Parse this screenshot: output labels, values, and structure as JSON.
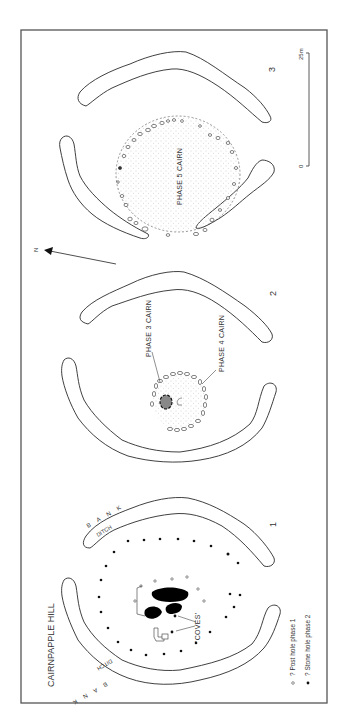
{
  "title": "CAIRNPAPPLE HILL",
  "phases": [
    {
      "number": "1",
      "labels": {
        "bank_top": "B A N K",
        "ditch_top": "DITCH",
        "bank_bottom": "B A N K",
        "ditch_bottom": "DITCH",
        "coves": "'COVES'"
      }
    },
    {
      "number": "2",
      "labels": {
        "phase3": "PHASE 3 CAIRN",
        "phase4": "PHASE 4 CAIRN"
      }
    },
    {
      "number": "3",
      "labels": {
        "phase5": "PHASE 5 CAIRN"
      }
    }
  ],
  "north_arrow": {
    "label": "N"
  },
  "scale_bar": {
    "start": "0",
    "end": "25m"
  },
  "legend": [
    {
      "symbol": "open-circle",
      "text": "? Post hole phase 1"
    },
    {
      "symbol": "filled-circle",
      "text": "? Stone hole phase 2"
    }
  ],
  "colors": {
    "line": "#2a2a2a",
    "frame": "#555555",
    "stipple": "#bbbbbb",
    "background": "#ffffff"
  }
}
